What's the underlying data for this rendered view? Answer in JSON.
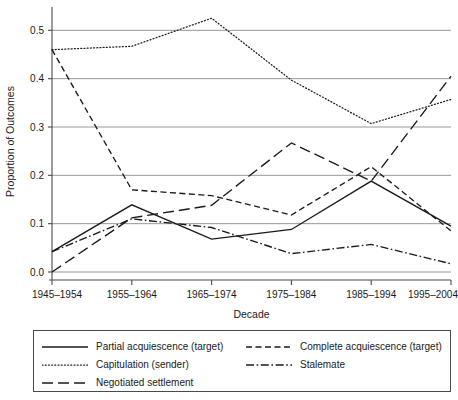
{
  "chart_data": {
    "type": "line",
    "title": "",
    "xlabel": "Decade",
    "ylabel": "Proportion of Outcomes",
    "categories": [
      "1945–1954",
      "1955–1964",
      "1965–1974",
      "1975–1984",
      "1985–1994",
      "1995–2004"
    ],
    "ylim": [
      0.0,
      0.54
    ],
    "xlim": [
      0,
      5
    ],
    "yticks": [
      "0.0",
      "0.1",
      "0.2",
      "0.3",
      "0.4",
      "0.5"
    ],
    "ytick_values": [
      0.0,
      0.1,
      0.2,
      0.3,
      0.4,
      0.5
    ],
    "grid": "horizontal",
    "legend_position": "below-plot-boxed",
    "series": [
      {
        "name": "Partial acquiescence (target)",
        "dash": "solid",
        "color": "#1a1a1a",
        "values": [
          0.042,
          0.139,
          0.068,
          0.088,
          0.188,
          0.095
        ]
      },
      {
        "name": "Complete acquiescence (target)",
        "dash": "dashed",
        "color": "#1a1a1a",
        "values": [
          0.46,
          0.17,
          0.158,
          0.118,
          0.218,
          0.085
        ]
      },
      {
        "name": "Capitulation (sender)",
        "dash": "dotted",
        "color": "#1a1a1a",
        "values": [
          0.46,
          0.467,
          0.525,
          0.397,
          0.307,
          0.357
        ]
      },
      {
        "name": "Stalemate",
        "dash": "dashdot",
        "color": "#1a1a1a",
        "values": [
          0.042,
          0.11,
          0.092,
          0.038,
          0.057,
          0.017
        ]
      },
      {
        "name": "Negotiated settlement",
        "dash": "longdash",
        "color": "#1a1a1a",
        "values": [
          0.0,
          0.112,
          0.138,
          0.267,
          0.188,
          0.405
        ]
      }
    ]
  },
  "axis": {
    "ylabel": "Proportion of Outcomes",
    "xlabel": "Decade",
    "ytick_0": "0.0",
    "ytick_1": "0.1",
    "ytick_2": "0.2",
    "ytick_3": "0.3",
    "ytick_4": "0.4",
    "ytick_5": "0.5",
    "xtick_0": "1945–1954",
    "xtick_1": "1955–1964",
    "xtick_2": "1965–1974",
    "xtick_3": "1975–1984",
    "xtick_4": "1985–1994",
    "xtick_5": "1995–2004"
  },
  "legend": {
    "entries": [
      {
        "label": "Partial acquiescence (target)",
        "dash": "solid",
        "icon": "solid-line-icon"
      },
      {
        "label": "Capitulation (sender)",
        "dash": "dotted",
        "icon": "dotted-line-icon"
      },
      {
        "label": "Negotiated settlement",
        "dash": "longdash",
        "icon": "long-dashed-line-icon"
      },
      {
        "label": "Complete acquiescence (target)",
        "dash": "dashed",
        "icon": "dashed-line-icon"
      },
      {
        "label": "Stalemate",
        "dash": "dashdot",
        "icon": "dash-dot-line-icon"
      }
    ]
  },
  "colors": {
    "ink": "#1a1a1a",
    "grid": "#8c8c8c",
    "axis": "#4a4a4a",
    "background": "#ffffff"
  }
}
